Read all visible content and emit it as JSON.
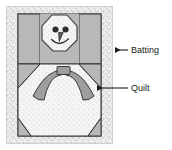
{
  "diagram": {
    "annotations": [
      {
        "id": "batting",
        "label": "Batting",
        "pointer": "arrow-left",
        "target": "outer speckled border of the quilt"
      },
      {
        "id": "quilt",
        "label": "Quilt",
        "pointer": "line-with-arrow-left",
        "target": "pieced quilt top interior"
      }
    ],
    "motif": {
      "name": "snowman",
      "parts": [
        "head",
        "left-eye",
        "right-eye",
        "carrot-nose",
        "smile",
        "scarf-knot",
        "scarf-left-tail",
        "scarf-right-tail",
        "body"
      ]
    },
    "patches": [
      "upper-left-gray-block",
      "upper-right-gray-block",
      "left-gray-background",
      "right-gray-background",
      "lower-left-gray-corner",
      "lower-right-gray-corner"
    ],
    "colors": {
      "batting": "#e8e8e8",
      "patch_gray": "#b8b8b8",
      "snow_white": "#f4f4f2",
      "scarf_gray": "#9e9e9e",
      "outline": "#3a3a3a",
      "label_text": "#1a1a1a",
      "page_background": "#ffffff"
    }
  }
}
